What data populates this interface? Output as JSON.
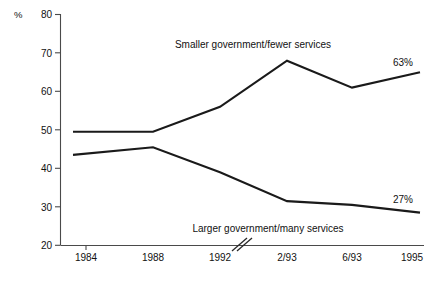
{
  "chart_data": {
    "type": "line",
    "title": "",
    "subtitle": "",
    "xlabel": "",
    "ylabel": "%",
    "ylim": [
      20,
      80
    ],
    "yticks": [
      20,
      30,
      40,
      50,
      60,
      70,
      80
    ],
    "ytick_labels": [
      "20",
      "30",
      "40",
      "50",
      "60",
      "70",
      "80"
    ],
    "categories": [
      "1984",
      "1988",
      "1992",
      "2/93",
      "6/93",
      "1995"
    ],
    "grid": false,
    "legend_position": "inline-annotation",
    "axis_break": {
      "present": true,
      "location": "x-axis between 1992 and 2/93",
      "glyph": "//"
    },
    "series": [
      {
        "name": "Smaller government/fewer services",
        "values": [
          49.5,
          49.5,
          56,
          68,
          61,
          65
        ],
        "end_label": "63%",
        "annotation": "Smaller government/fewer services"
      },
      {
        "name": "Larger government/many services",
        "values": [
          43.5,
          45.5,
          39,
          31.5,
          30.5,
          28.5
        ],
        "end_label": "27%",
        "annotation": "Larger government/many services"
      }
    ],
    "annotations": [
      {
        "text": "Smaller government/fewer services",
        "series": "Smaller government/fewer services"
      },
      {
        "text": "Larger government/many services",
        "series": "Larger government/many services"
      },
      {
        "text": "63%",
        "series": "Smaller government/fewer services"
      },
      {
        "text": "27%",
        "series": "Larger government/many services"
      }
    ],
    "colors": {
      "line": "#1a1a1a",
      "axis": "#4a4a4a",
      "text": "#111111",
      "background": "#ffffff"
    }
  },
  "axis": {
    "y_unit_label": "%",
    "y_ticks": [
      "80",
      "70",
      "60",
      "50",
      "40",
      "30",
      "20"
    ],
    "x_ticks": [
      "1984",
      "1988",
      "1992",
      "2/93",
      "6/93",
      "1995"
    ],
    "break_glyph": "//"
  },
  "labels": {
    "upper_series_annotation": "Smaller government/fewer services",
    "lower_series_annotation": "Larger government/many services",
    "upper_end_value": "63%",
    "lower_end_value": "27%"
  }
}
